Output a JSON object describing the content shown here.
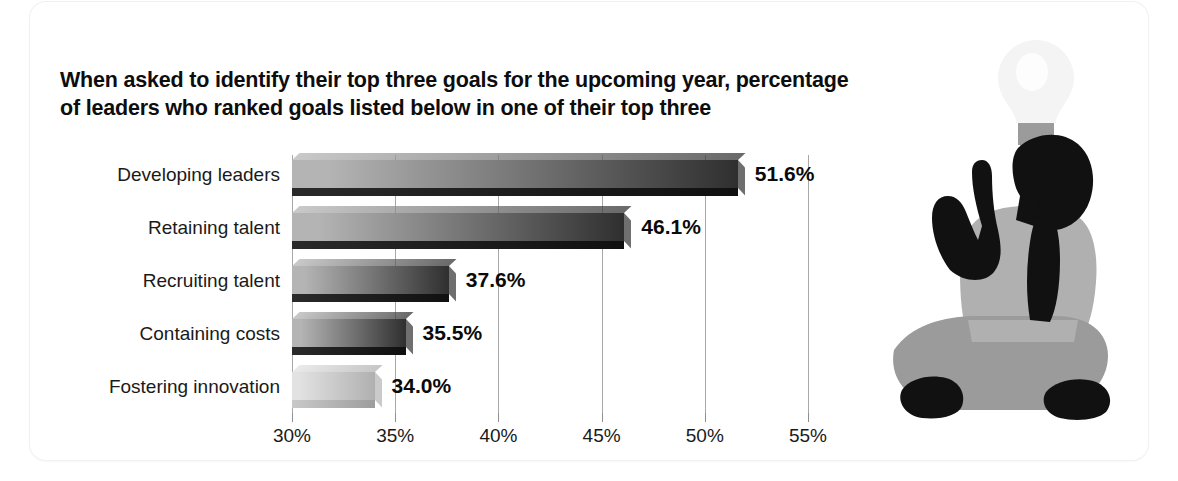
{
  "title": "When asked to identify their top three goals for the upcoming year, percentage of leaders who ranked goals listed below in one of their top three",
  "illustration": {
    "name": "seated-person-pointing-up-with-lightbulb",
    "bulb_label": "lightbulb-icon",
    "person_label": "seated-person-silhouette"
  },
  "colors": {
    "bar_light": "#b4b4b4",
    "bar_dark": "#2f2f2f",
    "bar_last_light": "#e2e2e2",
    "bar_last_dark": "#b0b0b0",
    "shadow": "#1d1d1d",
    "gridline": "#a8a8a8",
    "text": "#1a1a1a",
    "silhouette_dark": "#111111",
    "silhouette_gray": "#9b9b9b",
    "silhouette_gray_light": "#b0b0b0"
  },
  "chart_data": {
    "type": "bar",
    "orientation": "horizontal",
    "title": "When asked to identify their top three goals for the upcoming year, percentage of leaders who ranked goals listed below in one of their top three",
    "xlabel": "",
    "ylabel": "",
    "categories": [
      "Developing leaders",
      "Retaining talent",
      "Recruiting talent",
      "Containing costs",
      "Fostering innovation"
    ],
    "values": [
      51.6,
      46.1,
      37.6,
      35.5,
      34.0
    ],
    "value_labels": [
      "51.6%",
      "46.1%",
      "37.6%",
      "35.5%",
      "34.0%"
    ],
    "xlim": [
      30,
      55
    ],
    "xticks": [
      30,
      35,
      40,
      45,
      50,
      55
    ],
    "xtick_labels": [
      "30%",
      "35%",
      "40%",
      "45%",
      "50%",
      "55%"
    ],
    "grid": true,
    "legend": "none",
    "units": "percent"
  }
}
